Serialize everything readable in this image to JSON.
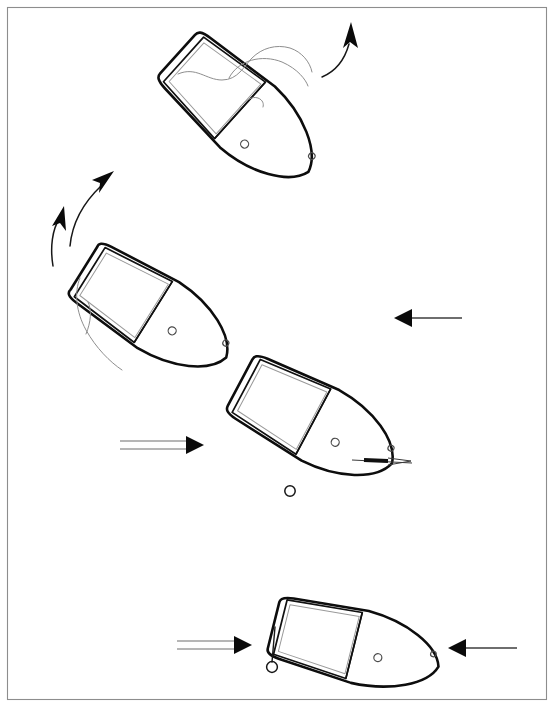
{
  "figure": {
    "background_color": "#ffffff",
    "frame": {
      "name": "page-border",
      "x": 7,
      "y": 7,
      "width": 539,
      "height": 692,
      "stroke_color": "#8d8d8d"
    },
    "ink_color": "#0d0d0d",
    "secondary_ink_color": "#8e8e8e"
  },
  "boats": [
    {
      "id": "boat-1",
      "label": "upper boat",
      "position_index": 1,
      "heading_degrees": 42,
      "center_x": 243,
      "center_y": 113,
      "length_px": 175,
      "beam_px": 82,
      "has_deck_panel": true,
      "has_thwart": true,
      "has_bow_eye": true,
      "has_mooring_rope": true,
      "has_tiller": false,
      "has_painter_ring": false
    },
    {
      "id": "boat-2",
      "label": "middle-left boat",
      "position_index": 2,
      "heading_degrees": 32,
      "center_x": 155,
      "center_y": 313,
      "length_px": 168,
      "beam_px": 80,
      "has_deck_panel": true,
      "has_thwart": true,
      "has_bow_eye": true,
      "has_mooring_rope": true,
      "has_tiller": false,
      "has_painter_ring": false
    },
    {
      "id": "boat-3",
      "label": "middle-right boat",
      "position_index": 3,
      "heading_degrees": 28,
      "center_x": 316,
      "center_y": 423,
      "length_px": 172,
      "beam_px": 82,
      "has_deck_panel": true,
      "has_thwart": true,
      "has_bow_eye": true,
      "has_mooring_rope": false,
      "has_tiller": true,
      "has_painter_ring": false
    },
    {
      "id": "boat-4",
      "label": "lower boat",
      "position_index": 4,
      "heading_degrees": 14,
      "center_x": 356,
      "center_y": 646,
      "length_px": 170,
      "beam_px": 76,
      "has_deck_panel": true,
      "has_thwart": true,
      "has_bow_eye": true,
      "has_mooring_rope": false,
      "has_tiller": false,
      "has_painter_ring": true
    }
  ],
  "curved_arrows": [
    {
      "id": "curved-arrow-upper",
      "name": "rotation-arrow-upper",
      "description": "curved arrow sweeping up and right from boat 1 bow",
      "direction": "up",
      "tip_x": 351,
      "tip_y": 24
    },
    {
      "id": "curved-arrow-mid-upper",
      "name": "rotation-arrow-mid-upper",
      "description": "curved arrow pointing up-right between boat 2 and boat 1",
      "direction": "up-right",
      "tip_x": 113,
      "tip_y": 172
    },
    {
      "id": "curved-arrow-mid-lower",
      "name": "rotation-arrow-mid-lower",
      "description": "curved arrow pointing up from below boat 2",
      "direction": "up",
      "tip_x": 63,
      "tip_y": 208
    }
  ],
  "straight_arrows": [
    {
      "id": "arrow-right-middle",
      "name": "current-arrow-right-middle",
      "direction": "right",
      "style": "double-line",
      "x_start": 120,
      "x_end": 190,
      "y": 445
    },
    {
      "id": "arrow-left-middle",
      "name": "current-arrow-left-middle",
      "direction": "left",
      "style": "single-line",
      "x_start": 462,
      "x_end": 408,
      "y": 318
    },
    {
      "id": "arrow-right-bottom",
      "name": "current-arrow-right-bottom",
      "direction": "right",
      "style": "double-line",
      "x_start": 177,
      "x_end": 238,
      "y": 645
    },
    {
      "id": "arrow-left-bottom",
      "name": "current-arrow-left-bottom",
      "direction": "left",
      "style": "single-line",
      "x_start": 517,
      "x_end": 462,
      "y": 648
    }
  ],
  "marks": [
    {
      "id": "mooring-buoy",
      "name": "buoy-mark",
      "shape": "circle",
      "cx": 290,
      "cy": 491,
      "r": 5.2
    }
  ]
}
